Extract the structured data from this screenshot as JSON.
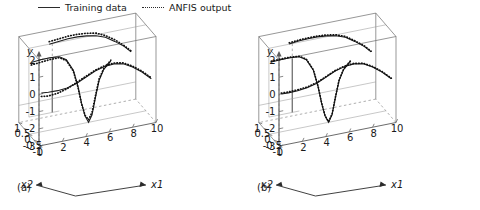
{
  "legend": {
    "entries": [
      {
        "label": "Training data",
        "style": "solid",
        "icon": "solid-line-icon"
      },
      {
        "label": "ANFIS output",
        "style": "dotted",
        "icon": "dotted-line-icon"
      }
    ]
  },
  "panels": [
    {
      "id": "a",
      "caption": "(a)",
      "axes": {
        "y": {
          "name": "y",
          "ticks": [
            "2",
            "1",
            "0",
            "-1",
            "-2",
            "-3"
          ],
          "values": [
            2,
            1,
            0,
            -1,
            -2,
            -3
          ],
          "range": [
            -3,
            2
          ]
        },
        "x1": {
          "name": "x1",
          "ticks": [
            "0",
            "2",
            "4",
            "6",
            "8",
            "10"
          ],
          "values": [
            0,
            2,
            4,
            6,
            8,
            10
          ],
          "range": [
            0,
            10
          ]
        },
        "x2": {
          "name": "x2",
          "ticks": [
            "1",
            "0.5",
            "0",
            "-0.5",
            "-1"
          ],
          "values": [
            1,
            0.5,
            0,
            -0.5,
            -1
          ],
          "range": [
            -1,
            1
          ]
        }
      }
    },
    {
      "id": "b",
      "caption": "(b)",
      "axes": {
        "y": {
          "name": "y",
          "ticks": [
            "2",
            "1",
            "0",
            "-1",
            "-2",
            "-3"
          ],
          "values": [
            2,
            1,
            0,
            -1,
            -2,
            -3
          ],
          "range": [
            -3,
            2
          ]
        },
        "x1": {
          "name": "x1",
          "ticks": [
            "0",
            "2",
            "4",
            "6",
            "8",
            "10"
          ],
          "values": [
            0,
            2,
            4,
            6,
            8,
            10
          ],
          "range": [
            0,
            10
          ]
        },
        "x2": {
          "name": "x2",
          "ticks": [
            "1",
            "0.5",
            "0",
            "-0.5",
            "-1"
          ],
          "values": [
            1,
            0.5,
            0,
            -0.5,
            -1
          ],
          "range": [
            -1,
            1
          ]
        }
      }
    }
  ],
  "chart_data": {
    "type": "line",
    "title": "",
    "subtitle": "",
    "xlabel": "x1",
    "ylabel": "y",
    "zlabel": "x2",
    "grid": true,
    "legend_position": "top",
    "legend": [
      "Training data",
      "ANFIS output"
    ],
    "projection": "3d",
    "xlim": [
      0,
      10
    ],
    "ylim": [
      -3,
      2
    ],
    "zlim": [
      -1,
      1
    ],
    "panels": [
      {
        "id": "a",
        "caption": "(a)",
        "note": "ANFIS output deviates visibly from the training data",
        "series": [
          {
            "name": "Training data",
            "style": "solid",
            "curves": [
              {
                "x2": -1.0,
                "points": [
                  [
                    0.2,
                    0.05
                  ],
                  [
                    0.8,
                    0.02
                  ],
                  [
                    1.6,
                    0.0
                  ],
                  [
                    2.4,
                    0.05
                  ],
                  [
                    3.2,
                    0.2
                  ],
                  [
                    4.0,
                    0.45
                  ],
                  [
                    4.8,
                    0.7
                  ],
                  [
                    5.6,
                    0.85
                  ],
                  [
                    6.4,
                    0.9
                  ],
                  [
                    7.2,
                    0.8
                  ],
                  [
                    8.0,
                    0.5
                  ],
                  [
                    8.8,
                    0.1
                  ],
                  [
                    9.6,
                    -0.4
                  ]
                ]
              },
              {
                "x2": 0.0,
                "points": [
                  [
                    0.2,
                    1.15
                  ],
                  [
                    1.0,
                    1.2
                  ],
                  [
                    1.8,
                    1.2
                  ],
                  [
                    2.6,
                    1.15
                  ],
                  [
                    3.2,
                    0.9
                  ],
                  [
                    3.8,
                    0.2
                  ],
                  [
                    4.2,
                    -0.8
                  ],
                  [
                    4.5,
                    -1.8
                  ],
                  [
                    4.8,
                    -2.6
                  ],
                  [
                    5.1,
                    -3.0
                  ],
                  [
                    5.4,
                    -2.6
                  ],
                  [
                    5.7,
                    -1.6
                  ],
                  [
                    6.0,
                    -0.7
                  ],
                  [
                    6.4,
                    -0.1
                  ],
                  [
                    7.0,
                    0.3
                  ]
                ]
              },
              {
                "x2": 1.0,
                "points": [
                  [
                    2.6,
                    1.2
                  ],
                  [
                    3.4,
                    1.25
                  ],
                  [
                    4.2,
                    1.3
                  ],
                  [
                    5.0,
                    1.3
                  ],
                  [
                    5.8,
                    1.25
                  ],
                  [
                    6.6,
                    1.15
                  ],
                  [
                    7.4,
                    0.95
                  ],
                  [
                    8.2,
                    0.6
                  ],
                  [
                    9.0,
                    0.2
                  ],
                  [
                    9.6,
                    -0.2
                  ]
                ]
              }
            ]
          },
          {
            "name": "ANFIS output",
            "style": "dotted",
            "curves": [
              {
                "x2": -1.0,
                "points": [
                  [
                    0.2,
                    -0.15
                  ],
                  [
                    0.8,
                    -0.2
                  ],
                  [
                    1.6,
                    -0.15
                  ],
                  [
                    2.4,
                    0.0
                  ],
                  [
                    3.2,
                    0.25
                  ],
                  [
                    4.0,
                    0.5
                  ],
                  [
                    4.8,
                    0.75
                  ],
                  [
                    5.6,
                    0.9
                  ],
                  [
                    6.4,
                    0.95
                  ],
                  [
                    7.2,
                    0.85
                  ],
                  [
                    8.0,
                    0.55
                  ],
                  [
                    8.8,
                    0.15
                  ],
                  [
                    9.6,
                    -0.35
                  ]
                ]
              },
              {
                "x2": 0.0,
                "points": [
                  [
                    0.2,
                    1.0
                  ],
                  [
                    1.0,
                    1.05
                  ],
                  [
                    1.8,
                    1.1
                  ],
                  [
                    2.6,
                    1.1
                  ],
                  [
                    3.2,
                    0.85
                  ],
                  [
                    3.8,
                    0.15
                  ],
                  [
                    4.2,
                    -0.85
                  ],
                  [
                    4.5,
                    -1.85
                  ],
                  [
                    4.8,
                    -2.55
                  ],
                  [
                    5.1,
                    -2.85
                  ],
                  [
                    5.4,
                    -2.45
                  ],
                  [
                    5.7,
                    -1.5
                  ],
                  [
                    6.0,
                    -0.6
                  ],
                  [
                    6.4,
                    -0.05
                  ],
                  [
                    7.0,
                    0.35
                  ]
                ]
              },
              {
                "x2": 1.0,
                "points": [
                  [
                    2.6,
                    1.35
                  ],
                  [
                    3.4,
                    1.4
                  ],
                  [
                    4.2,
                    1.45
                  ],
                  [
                    5.0,
                    1.45
                  ],
                  [
                    5.8,
                    1.4
                  ],
                  [
                    6.6,
                    1.3
                  ],
                  [
                    7.4,
                    1.05
                  ],
                  [
                    8.2,
                    0.7
                  ],
                  [
                    9.0,
                    0.25
                  ],
                  [
                    9.6,
                    -0.15
                  ]
                ]
              }
            ]
          }
        ]
      },
      {
        "id": "b",
        "caption": "(b)",
        "note": "ANFIS output closely overlays the training data",
        "series": [
          {
            "name": "Training data",
            "style": "solid",
            "curves": [
              {
                "x2": -1.0,
                "points": [
                  [
                    0.2,
                    0.0
                  ],
                  [
                    0.8,
                    -0.02
                  ],
                  [
                    1.6,
                    0.0
                  ],
                  [
                    2.4,
                    0.06
                  ],
                  [
                    3.2,
                    0.2
                  ],
                  [
                    4.0,
                    0.45
                  ],
                  [
                    4.8,
                    0.7
                  ],
                  [
                    5.6,
                    0.85
                  ],
                  [
                    6.4,
                    0.9
                  ],
                  [
                    7.2,
                    0.8
                  ],
                  [
                    8.0,
                    0.5
                  ],
                  [
                    8.8,
                    0.1
                  ],
                  [
                    9.6,
                    -0.4
                  ]
                ]
              },
              {
                "x2": 0.0,
                "points": [
                  [
                    0.2,
                    1.18
                  ],
                  [
                    1.0,
                    1.2
                  ],
                  [
                    1.8,
                    1.2
                  ],
                  [
                    2.6,
                    1.15
                  ],
                  [
                    3.2,
                    0.9
                  ],
                  [
                    3.8,
                    0.2
                  ],
                  [
                    4.2,
                    -0.8
                  ],
                  [
                    4.5,
                    -1.8
                  ],
                  [
                    4.8,
                    -2.6
                  ],
                  [
                    5.1,
                    -3.0
                  ],
                  [
                    5.4,
                    -2.6
                  ],
                  [
                    5.7,
                    -1.6
                  ],
                  [
                    6.0,
                    -0.7
                  ],
                  [
                    6.4,
                    -0.1
                  ],
                  [
                    7.0,
                    0.3
                  ]
                ]
              },
              {
                "x2": 1.0,
                "points": [
                  [
                    2.6,
                    1.22
                  ],
                  [
                    3.4,
                    1.28
                  ],
                  [
                    4.2,
                    1.3
                  ],
                  [
                    5.0,
                    1.3
                  ],
                  [
                    5.8,
                    1.25
                  ],
                  [
                    6.6,
                    1.15
                  ],
                  [
                    7.4,
                    0.95
                  ],
                  [
                    8.2,
                    0.6
                  ],
                  [
                    9.0,
                    0.2
                  ],
                  [
                    9.6,
                    -0.2
                  ]
                ]
              }
            ]
          },
          {
            "name": "ANFIS output",
            "style": "dotted",
            "curves": [
              {
                "x2": -1.0,
                "points": [
                  [
                    0.2,
                    0.05
                  ],
                  [
                    0.8,
                    0.03
                  ],
                  [
                    1.6,
                    0.05
                  ],
                  [
                    2.4,
                    0.1
                  ],
                  [
                    3.2,
                    0.24
                  ],
                  [
                    4.0,
                    0.48
                  ],
                  [
                    4.8,
                    0.73
                  ],
                  [
                    5.6,
                    0.88
                  ],
                  [
                    6.4,
                    0.93
                  ],
                  [
                    7.2,
                    0.83
                  ],
                  [
                    8.0,
                    0.53
                  ],
                  [
                    8.8,
                    0.13
                  ],
                  [
                    9.6,
                    -0.37
                  ]
                ]
              },
              {
                "x2": 0.0,
                "points": [
                  [
                    0.2,
                    1.22
                  ],
                  [
                    1.0,
                    1.24
                  ],
                  [
                    1.8,
                    1.24
                  ],
                  [
                    2.6,
                    1.18
                  ],
                  [
                    3.2,
                    0.93
                  ],
                  [
                    3.8,
                    0.23
                  ],
                  [
                    4.2,
                    -0.77
                  ],
                  [
                    4.5,
                    -1.77
                  ],
                  [
                    4.8,
                    -2.57
                  ],
                  [
                    5.1,
                    -2.96
                  ],
                  [
                    5.4,
                    -2.56
                  ],
                  [
                    5.7,
                    -1.56
                  ],
                  [
                    6.0,
                    -0.66
                  ],
                  [
                    6.4,
                    -0.06
                  ],
                  [
                    7.0,
                    0.34
                  ]
                ]
              },
              {
                "x2": 1.0,
                "points": [
                  [
                    2.6,
                    1.28
                  ],
                  [
                    3.4,
                    1.33
                  ],
                  [
                    4.2,
                    1.35
                  ],
                  [
                    5.0,
                    1.35
                  ],
                  [
                    5.8,
                    1.3
                  ],
                  [
                    6.6,
                    1.2
                  ],
                  [
                    7.4,
                    1.0
                  ],
                  [
                    8.2,
                    0.64
                  ],
                  [
                    9.0,
                    0.24
                  ],
                  [
                    9.6,
                    -0.16
                  ]
                ]
              }
            ]
          }
        ]
      }
    ]
  }
}
